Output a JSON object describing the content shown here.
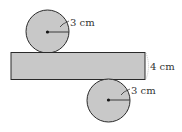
{
  "diagram": {
    "colors": {
      "fill": "#c8c8c8",
      "stroke": "#2a2a2a",
      "text": "#333333",
      "background": "#ffffff"
    },
    "top_circle": {
      "radius_label": "3 cm",
      "cx": 47.5,
      "cy": 31.5,
      "r": 21.5
    },
    "rectangle": {
      "height_label": "4 cm",
      "x": 11,
      "y": 52.5,
      "width": 134,
      "height": 27
    },
    "bottom_circle": {
      "radius_label": "3 cm",
      "cx": 108.5,
      "cy": 100.5,
      "r": 21.5
    }
  }
}
